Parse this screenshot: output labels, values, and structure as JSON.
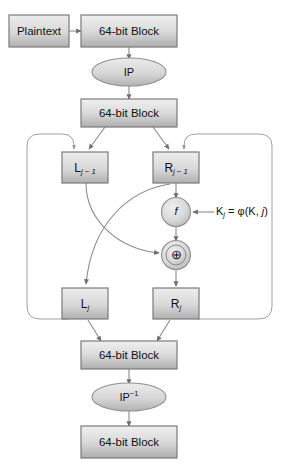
{
  "figure": {
    "domain": "diagram"
  },
  "colors": {
    "box_fill_light": "#e9e9e9",
    "box_fill_dark": "#b4b4b4",
    "ellipse_fill_light": "#e4e4e4",
    "ellipse_fill_dark": "#b8b8b8",
    "circle_fill_light": "#e6e6e6",
    "circle_fill_dark": "#bcbcbc",
    "stroke": "#7b7b7b",
    "edge": "#8a8a8a",
    "text": "#111111",
    "background": "#ffffff"
  },
  "nodes": {
    "plaintext": {
      "label": "Plaintext",
      "shape": "rect"
    },
    "block_in": {
      "label": "64-bit Block",
      "shape": "rect"
    },
    "ip": {
      "label": "IP",
      "shape": "ellipse"
    },
    "block_split": {
      "label": "64-bit Block",
      "shape": "rect"
    },
    "l_prev": {
      "label": "L",
      "sub": "j − 1",
      "shape": "rect"
    },
    "r_prev": {
      "label": "R",
      "sub": "j − 1",
      "shape": "rect"
    },
    "f_func": {
      "label": "f",
      "shape": "circle"
    },
    "xor": {
      "label": "⊕",
      "shape": "circle-double"
    },
    "l_next": {
      "label": "L",
      "sub": "j",
      "shape": "rect"
    },
    "r_next": {
      "label": "R",
      "sub": "j",
      "shape": "rect"
    },
    "block_join": {
      "label": "64-bit Block",
      "shape": "rect"
    },
    "ip_inv": {
      "label": "IP",
      "sup": "−1",
      "shape": "ellipse"
    },
    "block_out": {
      "label": "64-bit Block",
      "shape": "rect"
    }
  },
  "annotations": {
    "key_schedule": {
      "text_prefix": "K",
      "text_sub": "j",
      "text_mid": " = φ(K, ",
      "text_var": "j",
      "text_suffix": ")",
      "full_text": "Kⱼ = φ(K, j)"
    }
  },
  "edges": [
    {
      "from": "plaintext",
      "to": "block_in",
      "name": "plaintext-to-block"
    },
    {
      "from": "block_in",
      "to": "ip",
      "name": "block-to-ip"
    },
    {
      "from": "ip",
      "to": "block_split",
      "name": "ip-to-block"
    },
    {
      "from": "block_split",
      "to": "l_prev",
      "name": "block-to-lprev"
    },
    {
      "from": "block_split",
      "to": "r_prev",
      "name": "block-to-rprev"
    },
    {
      "from": "r_prev",
      "to": "f_func",
      "name": "rprev-to-f"
    },
    {
      "from": "key_schedule",
      "to": "f_func",
      "name": "key-to-f"
    },
    {
      "from": "f_func",
      "to": "xor",
      "name": "f-to-xor"
    },
    {
      "from": "l_prev",
      "to": "xor",
      "name": "lprev-to-xor"
    },
    {
      "from": "r_prev",
      "to": "l_next",
      "name": "rprev-to-lnext"
    },
    {
      "from": "xor",
      "to": "r_next",
      "name": "xor-to-rnext"
    },
    {
      "from": "l_next",
      "to": "block_join",
      "name": "lnext-to-block"
    },
    {
      "from": "r_next",
      "to": "block_join",
      "name": "rnext-to-block"
    },
    {
      "from": "l_next",
      "to": "l_prev",
      "name": "left-feedback-loop"
    },
    {
      "from": "r_next",
      "to": "r_prev",
      "name": "right-feedback-loop"
    },
    {
      "from": "block_join",
      "to": "ip_inv",
      "name": "block-to-ipinv"
    },
    {
      "from": "ip_inv",
      "to": "block_out",
      "name": "ipinv-to-block"
    }
  ]
}
